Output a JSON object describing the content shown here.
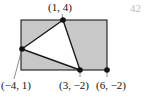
{
  "figure": {
    "name": "shaded-rectangle-with-inscribed-triangle",
    "page_number": "42",
    "colors": {
      "shaded_region": "#c8c8c8",
      "triangle_fill": "#ffffff",
      "stroke": "#1a1a1a",
      "page_number": "#b9b9b9",
      "background": "#ffffff"
    },
    "labels": {
      "top": "(1, 4)",
      "left": "(−4, 1)",
      "bottom": "(3, −2)",
      "bottom_right": "(6, −2)"
    },
    "points": [
      {
        "label": "(1, 4)",
        "x": 1,
        "y": 4,
        "px": 63,
        "py": 20
      },
      {
        "label": "(−4, 1)",
        "x": -4,
        "y": 1,
        "px": 22,
        "py": 49
      },
      {
        "label": "(3, −2)",
        "x": 3,
        "y": -2,
        "px": 80,
        "py": 70
      },
      {
        "label": "(6, −2)",
        "x": 6,
        "y": -2,
        "px": 107,
        "py": 70
      }
    ],
    "rectangle": {
      "left_px": 21,
      "top_px": 20,
      "right_px": 107,
      "bottom_px": 70
    },
    "triangle_vertices": [
      "(1, 4)",
      "(−4, 1)",
      "(3, −2)"
    ]
  }
}
